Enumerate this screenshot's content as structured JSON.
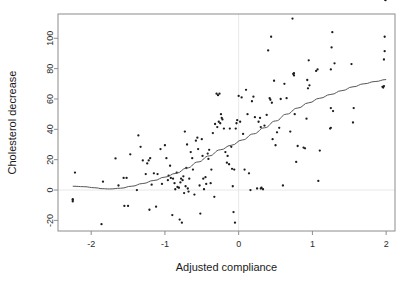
{
  "chart_data": {
    "type": "scatter",
    "title": "",
    "xlabel": "Adjusted compliance",
    "ylabel": "Cholesterol decrease",
    "xlim": [
      -2.45,
      2.12
    ],
    "ylim": [
      -27,
      116
    ],
    "xticks": [
      -2,
      -1,
      0,
      1,
      2
    ],
    "xtick_labels": [
      "-2",
      "-1",
      "0",
      "1",
      "2"
    ],
    "yticks": [
      -20,
      0,
      20,
      40,
      60,
      80,
      100
    ],
    "ytick_labels": [
      "-20",
      "0",
      "20",
      "40",
      "60",
      "80",
      "100"
    ],
    "grid": false,
    "reference_lines": [
      {
        "orientation": "vertical",
        "value": 0,
        "color": "#e8e8e8"
      },
      {
        "orientation": "horizontal",
        "value": 0,
        "color": "#e8e8e8"
      }
    ],
    "legend": null,
    "point_marker": "small-filled-circle",
    "point_color": "#1c1c1c",
    "curve_color": "#55565a",
    "curve_label": "lowess smooth",
    "n_points": 164,
    "x": [
      -2.25,
      -2.25,
      -2.25,
      -2.22,
      -1.86,
      -1.84,
      -1.67,
      -1.63,
      -1.56,
      -1.55,
      -1.52,
      -1.5,
      -1.47,
      -1.38,
      -1.36,
      -1.33,
      -1.3,
      -1.26,
      -1.24,
      -1.22,
      -1.21,
      -1.2,
      -1.18,
      -1.15,
      -1.12,
      -1.1,
      -1.06,
      -1.04,
      -1.0,
      -0.98,
      -0.96,
      -0.95,
      -0.93,
      -0.92,
      -0.9,
      -0.89,
      -0.87,
      -0.86,
      -0.84,
      -0.83,
      -0.81,
      -0.8,
      -0.79,
      -0.78,
      -0.77,
      -0.76,
      -0.75,
      -0.74,
      -0.73,
      -0.72,
      -0.71,
      -0.7,
      -0.69,
      -0.68,
      -0.67,
      -0.65,
      -0.63,
      -0.62,
      -0.6,
      -0.58,
      -0.56,
      -0.55,
      -0.53,
      -0.52,
      -0.5,
      -0.49,
      -0.48,
      -0.47,
      -0.45,
      -0.44,
      -0.42,
      -0.41,
      -0.4,
      -0.38,
      -0.37,
      -0.35,
      -0.33,
      -0.32,
      -0.3,
      -0.29,
      -0.28,
      -0.27,
      -0.26,
      -0.25,
      -0.24,
      -0.23,
      -0.22,
      -0.2,
      -0.18,
      -0.16,
      -0.15,
      -0.13,
      -0.12,
      -0.1,
      -0.09,
      -0.08,
      -0.07,
      -0.06,
      -0.05,
      -0.04,
      -0.03,
      -0.02,
      0.0,
      0.02,
      0.04,
      0.06,
      0.08,
      0.1,
      0.12,
      0.14,
      0.16,
      0.18,
      0.2,
      0.22,
      0.25,
      0.27,
      0.29,
      0.3,
      0.3,
      0.31,
      0.33,
      0.35,
      0.38,
      0.4,
      0.42,
      0.43,
      0.44,
      0.45,
      0.46,
      0.48,
      0.5,
      0.52,
      0.55,
      0.57,
      0.6,
      0.62,
      0.65,
      0.7,
      0.73,
      0.74,
      0.75,
      0.75,
      0.76,
      0.78,
      0.8,
      0.88,
      0.9,
      0.92,
      0.93,
      0.94,
      0.95,
      0.96,
      1.05,
      1.07,
      1.08,
      1.1,
      1.24,
      1.25,
      1.25,
      1.25,
      1.26,
      1.27,
      1.28,
      1.3,
      1.53,
      1.55,
      1.56,
      1.95,
      1.96,
      1.97,
      1.97,
      1.98,
      1.98,
      1.99,
      1.99
    ],
    "y": [
      -6.0,
      -6.5,
      -7.5,
      11.5,
      -22.5,
      5.5,
      20.8,
      3.0,
      8.0,
      -10.5,
      8.0,
      -10.5,
      23.5,
      0.0,
      36.0,
      28.5,
      19.5,
      10.5,
      17.5,
      19.5,
      -13.0,
      21.0,
      3.5,
      11.0,
      -11.0,
      10.5,
      27.0,
      4.0,
      29.5,
      21.0,
      6.5,
      9.5,
      16.0,
      8.0,
      -16.5,
      7.5,
      4.5,
      0.5,
      11.5,
      2.0,
      1.5,
      -19.5,
      5.0,
      7.5,
      -21.5,
      6.5,
      9.0,
      -2.0,
      38.5,
      2.5,
      14.5,
      30.0,
      1.0,
      -1.0,
      7.5,
      25.0,
      21.0,
      13.5,
      -3.0,
      32.5,
      34.5,
      27.0,
      3.0,
      -15.5,
      33.5,
      22.5,
      7.5,
      0.5,
      8.5,
      4.0,
      24.0,
      20.5,
      26.5,
      4.5,
      13.5,
      37.5,
      -4.5,
      43.5,
      63.5,
      41.5,
      62.5,
      45.0,
      63.5,
      44.0,
      50.0,
      47.5,
      46.5,
      40.5,
      25.0,
      18.0,
      22.5,
      17.0,
      40.5,
      28.5,
      14.0,
      2.5,
      -14.5,
      13.5,
      -21.5,
      40.5,
      44.0,
      46.0,
      62.0,
      45.0,
      61.0,
      37.0,
      13.5,
      66.0,
      50.0,
      11.0,
      0.0,
      58.5,
      61.5,
      48.0,
      1.0,
      45.0,
      47.5,
      41.5,
      1.0,
      1.5,
      0.5,
      42.5,
      49.5,
      92.0,
      60.5,
      59.5,
      101.0,
      57.5,
      33.5,
      72.0,
      29.5,
      38.0,
      41.0,
      60.0,
      3.0,
      70.0,
      60.5,
      38.5,
      113.0,
      76.5,
      75.5,
      77.0,
      50.0,
      18.5,
      29.0,
      28.0,
      27.5,
      47.0,
      72.5,
      67.0,
      85.5,
      69.0,
      78.5,
      79.5,
      6.0,
      26.0,
      40.5,
      41.0,
      54.0,
      79.5,
      94.0,
      104.0,
      52.0,
      83.5,
      83.0,
      44.5,
      54.0,
      68.0,
      67.5,
      68.5,
      86.0,
      91.5,
      101.0
    ],
    "curve_points": [
      [
        -2.25,
        2.5
      ],
      [
        -2.1,
        2.2
      ],
      [
        -1.95,
        1.5
      ],
      [
        -1.85,
        0.9
      ],
      [
        -1.75,
        0.7
      ],
      [
        -1.6,
        1.2
      ],
      [
        -1.45,
        2.5
      ],
      [
        -1.3,
        4.3
      ],
      [
        -1.15,
        6.3
      ],
      [
        -1.0,
        8.5
      ],
      [
        -0.85,
        11.0
      ],
      [
        -0.7,
        14.5
      ],
      [
        -0.55,
        18.5
      ],
      [
        -0.4,
        22.5
      ],
      [
        -0.25,
        26.5
      ],
      [
        -0.1,
        29.5
      ],
      [
        0.05,
        33.0
      ],
      [
        0.2,
        37.0
      ],
      [
        0.35,
        41.0
      ],
      [
        0.5,
        45.5
      ],
      [
        0.65,
        50.0
      ],
      [
        0.8,
        54.0
      ],
      [
        0.95,
        57.5
      ],
      [
        1.1,
        60.5
      ],
      [
        1.25,
        63.0
      ],
      [
        1.4,
        65.5
      ],
      [
        1.55,
        68.0
      ],
      [
        1.7,
        70.0
      ],
      [
        1.85,
        71.5
      ],
      [
        2.0,
        72.8
      ]
    ]
  },
  "layout": {
    "plot_left": 58,
    "plot_right": 395,
    "plot_top": 14,
    "plot_bottom": 231
  }
}
